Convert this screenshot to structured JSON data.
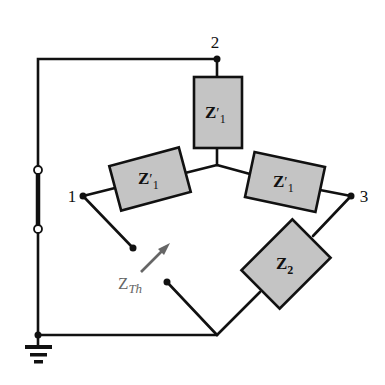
{
  "diagram": {
    "nodes": [
      {
        "id": "node-1",
        "label": "1"
      },
      {
        "id": "node-2",
        "label": "2"
      },
      {
        "id": "node-3",
        "label": "3"
      }
    ],
    "impedances": [
      {
        "id": "z1-top",
        "main": "Z",
        "prime": "′",
        "sub": "1"
      },
      {
        "id": "z1-left",
        "main": "Z",
        "prime": "′",
        "sub": "1"
      },
      {
        "id": "z1-right",
        "main": "Z",
        "prime": "′",
        "sub": "1"
      },
      {
        "id": "z2",
        "main": "Z",
        "prime": "",
        "sub": "2"
      }
    ],
    "thevenin": {
      "main": "Z",
      "sub": "Th"
    },
    "colors": {
      "wire": "#111111",
      "box_fill": "#c4c4c4",
      "thevenin_label": "#666666"
    }
  }
}
